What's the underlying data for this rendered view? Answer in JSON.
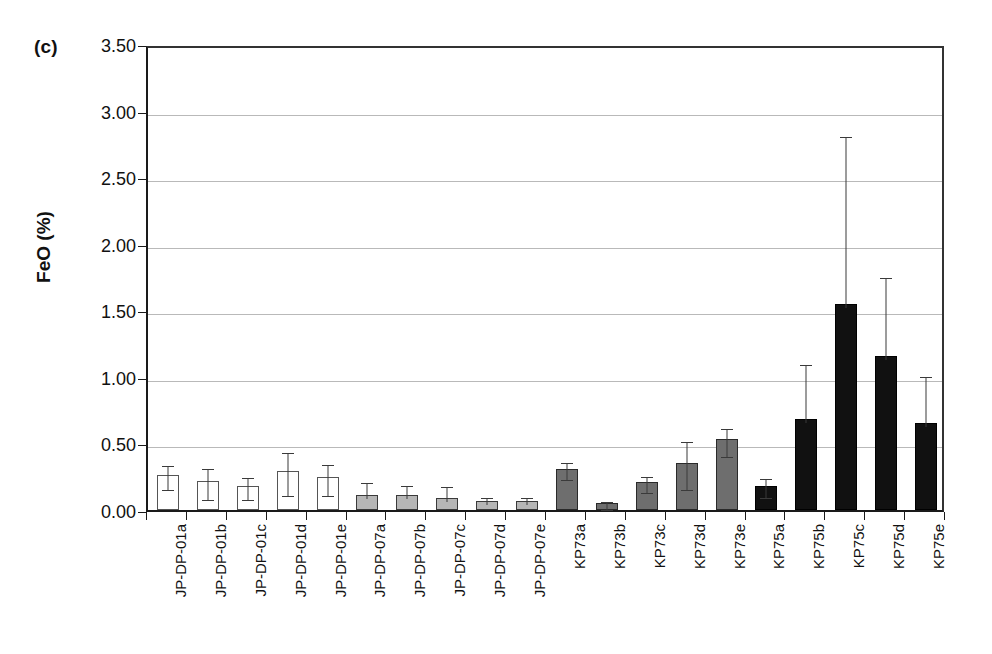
{
  "figure": {
    "panel_label": "(c)",
    "ylabel": "FeO (%)"
  },
  "chart_data": {
    "type": "bar",
    "title": "",
    "subtitle": "",
    "xlabel": "",
    "ylabel": "FeO (%)",
    "ylim": [
      0.0,
      3.5
    ],
    "ytick_labels": [
      "0.00",
      "0.50",
      "1.00",
      "1.50",
      "2.00",
      "2.50",
      "3.00",
      "3.50"
    ],
    "ytick_values": [
      0.0,
      0.5,
      1.0,
      1.5,
      2.0,
      2.5,
      3.0,
      3.5
    ],
    "grid": true,
    "grid_axis": "y",
    "legend": "none",
    "legend_position": "none",
    "error_bars": "asymmetric",
    "categories": [
      "JP-DP-01a",
      "JP-DP-01b",
      "JP-DP-01c",
      "JP-DP-01d",
      "JP-DP-01e",
      "JP-DP-07a",
      "JP-DP-07b",
      "JP-DP-07c",
      "JP-DP-07d",
      "JP-DP-07e",
      "KP73a",
      "KP73b",
      "KP73c",
      "KP73d",
      "KP73e",
      "KP75a",
      "KP75b",
      "KP75c",
      "KP75d",
      "KP75e"
    ],
    "values": [
      0.26,
      0.22,
      0.18,
      0.29,
      0.25,
      0.11,
      0.11,
      0.09,
      0.07,
      0.07,
      0.31,
      0.05,
      0.21,
      0.35,
      0.53,
      0.18,
      0.68,
      1.55,
      1.16,
      0.65
    ],
    "err_upper": [
      0.36,
      0.34,
      0.27,
      0.46,
      0.37,
      0.23,
      0.21,
      0.2,
      0.12,
      0.12,
      0.38,
      0.09,
      0.28,
      0.54,
      0.64,
      0.26,
      1.12,
      2.83,
      1.77,
      1.03
    ],
    "err_lower": [
      0.17,
      0.1,
      0.1,
      0.13,
      0.13,
      0.0,
      0.0,
      0.0,
      0.0,
      0.0,
      0.25,
      0.02,
      0.15,
      0.17,
      0.42,
      0.11,
      0.0,
      0.0,
      0.0,
      0.0
    ],
    "fill_styles": [
      "white",
      "white",
      "white",
      "white",
      "white",
      "lightgray",
      "lightgray",
      "lightgray",
      "lightgray",
      "lightgray",
      "gray",
      "gray",
      "gray",
      "gray",
      "gray",
      "black",
      "black",
      "black",
      "black",
      "black"
    ],
    "group_colors": {
      "white": "#ffffff",
      "lightgray": "#b6b6b6",
      "gray": "#6e6e6e",
      "black": "#111111"
    },
    "axis_color": "#1a1a1a",
    "gridline_color": "#b9b9b9"
  }
}
